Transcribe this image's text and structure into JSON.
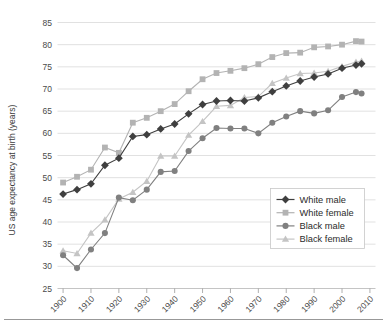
{
  "chart_data": {
    "type": "line",
    "title": "",
    "subtitle": "",
    "xlabel": "",
    "ylabel": "US age expectancy at birth (years)",
    "xlim": [
      1898,
      2012
    ],
    "ylim": [
      25,
      85
    ],
    "ytick_step": 5,
    "yticks": [
      25,
      30,
      35,
      40,
      45,
      50,
      55,
      60,
      65,
      70,
      75,
      80,
      85
    ],
    "xticks": [
      1900,
      1910,
      1920,
      1930,
      1940,
      1950,
      1960,
      1970,
      1980,
      1990,
      2000,
      2010
    ],
    "xtick_labels": [
      "1900",
      "1910",
      "1920",
      "1930",
      "1940",
      "1950",
      "1960",
      "1970",
      "1980",
      "1990",
      "2000",
      "2010"
    ],
    "xtick_rotation": 45,
    "grid": "horizontal",
    "legend_position": "lower-right",
    "x": [
      1900,
      1905,
      1910,
      1915,
      1920,
      1925,
      1930,
      1935,
      1940,
      1945,
      1950,
      1955,
      1960,
      1965,
      1970,
      1975,
      1980,
      1985,
      1990,
      1995,
      2000,
      2005,
      2007
    ],
    "series": [
      {
        "name": "White male",
        "color": "#3f3f3f",
        "marker": "diamond",
        "values": [
          46.3,
          47.3,
          48.6,
          52.8,
          54.4,
          59.3,
          59.7,
          61.0,
          62.1,
          64.4,
          66.5,
          67.3,
          67.4,
          67.3,
          68.0,
          69.4,
          70.7,
          71.8,
          72.7,
          73.4,
          74.7,
          75.4,
          75.7
        ]
      },
      {
        "name": "White female",
        "color": "#b3b3b3",
        "marker": "square",
        "values": [
          48.9,
          50.2,
          51.8,
          56.8,
          55.6,
          62.4,
          63.5,
          65.0,
          66.6,
          69.5,
          72.2,
          73.6,
          74.1,
          74.7,
          75.6,
          77.2,
          78.1,
          78.2,
          79.4,
          79.6,
          80.0,
          80.8,
          80.7
        ]
      },
      {
        "name": "Black male",
        "color": "#808080",
        "marker": "circle",
        "values": [
          32.5,
          29.6,
          33.8,
          37.5,
          45.5,
          44.9,
          47.3,
          51.3,
          51.5,
          56.0,
          58.9,
          61.2,
          61.1,
          61.1,
          60.0,
          62.4,
          63.8,
          65.0,
          64.5,
          65.2,
          68.2,
          69.3,
          69.0
        ]
      },
      {
        "name": "Black female",
        "color": "#c4c4c4",
        "marker": "triangle",
        "values": [
          33.5,
          32.9,
          37.5,
          40.5,
          45.2,
          46.7,
          49.2,
          54.9,
          54.9,
          59.6,
          62.7,
          66.1,
          66.3,
          68.1,
          68.3,
          71.3,
          72.5,
          73.5,
          73.6,
          74.0,
          75.1,
          76.1,
          76.3
        ]
      }
    ]
  },
  "axis": {
    "y_title": "US age expectancy at birth (years)"
  },
  "legend": {
    "items": [
      {
        "label": "White male"
      },
      {
        "label": "White female"
      },
      {
        "label": "Black male"
      },
      {
        "label": "Black female"
      }
    ]
  }
}
